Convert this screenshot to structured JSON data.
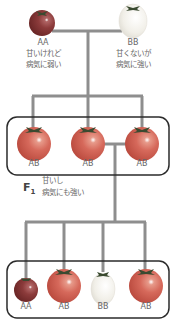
{
  "parents": [
    {
      "genotype": "AA",
      "desc_line1": "甘いけれど",
      "desc_line2": "病気に弱い",
      "color": "#8c3b3b"
    },
    {
      "genotype": "BB",
      "desc_line1": "甘くないが",
      "desc_line2": "病気に強い",
      "color": "#f3f1ea"
    }
  ],
  "f1": {
    "label": "F",
    "label_sub": "1",
    "desc_line1": "甘いし",
    "desc_line2": "病気にも強い",
    "offspring": [
      {
        "genotype": "AB",
        "color": "#d6695b"
      },
      {
        "genotype": "AB",
        "color": "#d6695b"
      },
      {
        "genotype": "AB",
        "color": "#d6695b"
      }
    ]
  },
  "f2": {
    "offspring": [
      {
        "genotype": "AA",
        "color": "#8c3b3b"
      },
      {
        "genotype": "AB",
        "color": "#d6695b"
      },
      {
        "genotype": "BB",
        "color": "#f3f1ea"
      },
      {
        "genotype": "AB",
        "color": "#d6695b"
      }
    ]
  },
  "colors": {
    "line": "#8e8e8e",
    "box": "#2b2b2b",
    "stem": "#3a4a30"
  }
}
